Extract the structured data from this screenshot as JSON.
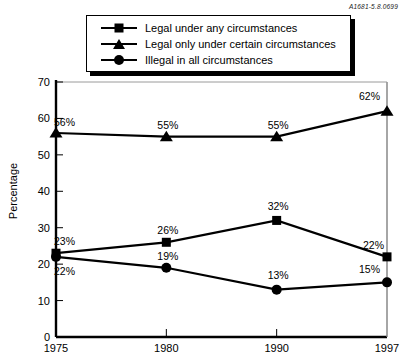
{
  "figure_id": "A1681-5.8.0699",
  "legend": {
    "items": [
      {
        "marker": "square-marker",
        "label": "Legal under any circumstances"
      },
      {
        "marker": "triangle-marker",
        "label": "Legal only under certain circumstances"
      },
      {
        "marker": "circle-marker",
        "label": "Illegal in all circumstances"
      }
    ]
  },
  "chart_data": {
    "type": "line",
    "title": "",
    "xlabel": "",
    "ylabel": "Percentage",
    "categories": [
      "1975",
      "1980",
      "1990",
      "1997"
    ],
    "ylim": [
      0,
      70
    ],
    "yticks": [
      0,
      10,
      20,
      30,
      40,
      50,
      60,
      70
    ],
    "ytick_labels": [
      "0",
      "10",
      "20",
      "30",
      "40",
      "50",
      "60",
      "70"
    ],
    "grid": false,
    "legend_position": "top",
    "series": [
      {
        "name": "Legal under any circumstances",
        "marker": "square",
        "values": [
          23,
          26,
          32,
          22
        ],
        "data_labels": [
          "23%",
          "26%",
          "32%",
          "22%"
        ]
      },
      {
        "name": "Legal only under certain circumstances",
        "marker": "triangle",
        "values": [
          56,
          55,
          55,
          62
        ],
        "data_labels": [
          "56%",
          "55%",
          "55%",
          "62%"
        ]
      },
      {
        "name": "Illegal in all circumstances",
        "marker": "circle",
        "values": [
          22,
          19,
          13,
          15
        ],
        "data_labels": [
          "22%",
          "19%",
          "13%",
          "15%"
        ]
      }
    ]
  },
  "colors": {
    "ink": "#000000",
    "frame": "#9a9a9a",
    "background": "#ffffff"
  }
}
